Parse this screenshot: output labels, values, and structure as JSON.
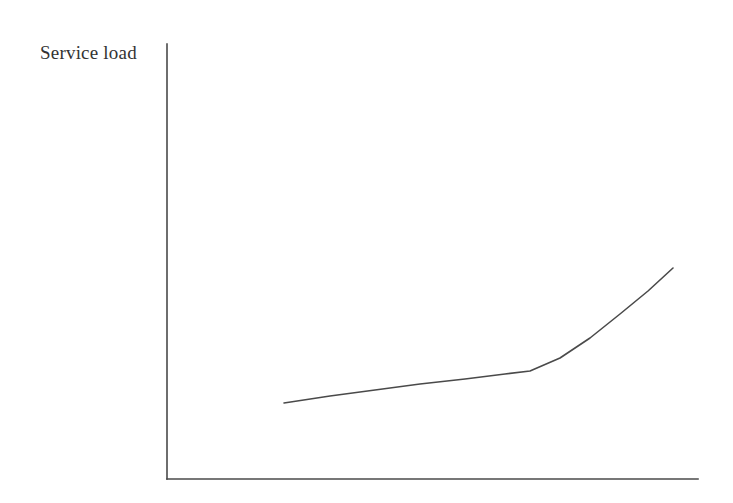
{
  "figure": {
    "background_color": "#ffffff",
    "width": 733,
    "height": 503
  },
  "labels": {
    "ylabel": "Service load",
    "xlabel": ""
  },
  "style": {
    "axis_color": "#4a4a4a",
    "curve_color": "#4a4a4a",
    "text_color": "#333333",
    "axis_width": 1.6,
    "curve_width": 1.6
  },
  "chart_data": {
    "type": "line",
    "title": "",
    "subtitle": "",
    "xlabel": "",
    "ylabel": "Service load",
    "grid": false,
    "legend": false,
    "legend_position": "none",
    "axis_ticks": {
      "x": [],
      "y": []
    },
    "axis_pixel_geometry": {
      "y_axis_x": 167,
      "y_axis_top_y": 44,
      "x_axis_y": 479,
      "x_axis_right_x": 698
    },
    "xlim": [
      0,
      1
    ],
    "ylim": [
      0,
      1
    ],
    "series": [
      {
        "name": "Service load curve",
        "description": "Gradual near-linear rise that bends sharply upward toward the right",
        "x": [
          0.22,
          0.28,
          0.34,
          0.4,
          0.465,
          0.53,
          0.608,
          0.675,
          0.74,
          0.81,
          0.875,
          0.953
        ],
        "y": [
          0.175,
          0.191,
          0.208,
          0.224,
          0.241,
          0.258,
          0.282,
          0.32,
          0.378,
          0.448,
          0.52,
          0.485
        ],
        "pixel_points": [
          [
            284,
            403
          ],
          [
            330,
            396
          ],
          [
            375,
            390
          ],
          [
            420,
            384
          ],
          [
            465,
            379
          ],
          [
            505,
            374
          ],
          [
            530,
            371
          ],
          [
            560,
            358
          ],
          [
            590,
            338
          ],
          [
            620,
            314
          ],
          [
            648,
            291
          ],
          [
            673,
            268
          ]
        ]
      }
    ]
  }
}
